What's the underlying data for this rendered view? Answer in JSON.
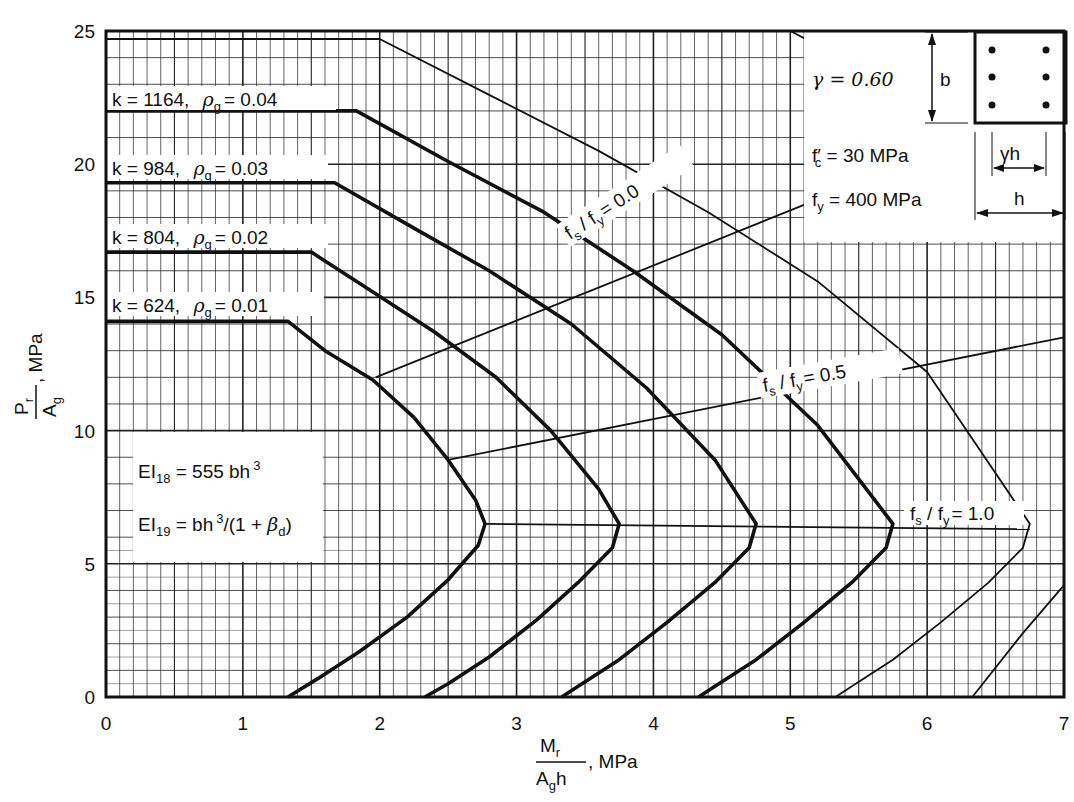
{
  "chart_data": {
    "type": "line",
    "title": "",
    "xlabel": "Mr / (Ag h), MPa",
    "ylabel": "Pr / Ag, MPa",
    "xlabel_parts": {
      "numerator": "M",
      "numerator_sub": "r",
      "denominator": "A",
      "denominator_sub": "g",
      "denominator_tail": "h",
      "unit": ", MPa"
    },
    "ylabel_parts": {
      "numerator": "P",
      "numerator_sub": "r",
      "denominator": "A",
      "denominator_sub": "g",
      "unit": ", MPa"
    },
    "xlim": [
      0,
      7
    ],
    "ylim": [
      0,
      25
    ],
    "xticks": [
      "0",
      "1",
      "2",
      "3",
      "4",
      "5",
      "6",
      "7"
    ],
    "yticks": [
      "0",
      "5",
      "10",
      "15",
      "20",
      "25"
    ],
    "grid": true,
    "parameters": {
      "gamma": "γ  =  0.60",
      "fc": "f′c  =  30  MPa",
      "fy": "fy  =  400  MPa"
    },
    "section_labels": {
      "b": "b",
      "gamma_h": "γh",
      "h": "h"
    },
    "stiffness_notes": [
      "EI18 = 555 bh³",
      "EI19 = bh³/(1 + βd)"
    ],
    "series": [
      {
        "name": "k = 624, ρg = 0.01",
        "k": "624",
        "rho_g": "0.01",
        "weight": "bold",
        "x": [
          0,
          1.33,
          1.6,
          1.95,
          2.25,
          2.5,
          2.7,
          2.77,
          2.72,
          2.5,
          2.2,
          1.85,
          1.55,
          1.33
        ],
        "y": [
          14.1,
          14.1,
          13.0,
          11.9,
          10.5,
          8.9,
          7.4,
          6.5,
          5.7,
          4.4,
          3.0,
          1.7,
          0.7,
          0
        ]
      },
      {
        "name": "k = 804, ρg = 0.02",
        "k": "804",
        "rho_g": "0.02",
        "weight": "bold",
        "x": [
          0,
          1.5,
          1.95,
          2.4,
          2.85,
          3.25,
          3.6,
          3.75,
          3.7,
          3.45,
          3.15,
          2.8,
          2.5,
          2.33
        ],
        "y": [
          16.7,
          16.7,
          15.2,
          13.7,
          12.0,
          10.0,
          7.8,
          6.5,
          5.6,
          4.3,
          2.9,
          1.5,
          0.5,
          0
        ]
      },
      {
        "name": "k = 984, ρg = 0.03",
        "k": "984",
        "rho_g": "0.03",
        "weight": "bold",
        "x": [
          0,
          1.67,
          2.25,
          2.8,
          3.4,
          3.95,
          4.45,
          4.75,
          4.7,
          4.45,
          4.1,
          3.75,
          3.45,
          3.33
        ],
        "y": [
          19.3,
          19.3,
          17.6,
          16.0,
          14.0,
          11.6,
          8.9,
          6.5,
          5.6,
          4.3,
          2.8,
          1.4,
          0.4,
          0
        ]
      },
      {
        "name": "k = 1164, ρg = 0.04",
        "k": "1164",
        "rho_g": "0.04",
        "weight": "bold",
        "x": [
          0,
          1.83,
          2.5,
          3.2,
          3.85,
          4.5,
          5.2,
          5.75,
          5.7,
          5.45,
          5.1,
          4.75,
          4.45,
          4.33
        ],
        "y": [
          22.0,
          22.0,
          20.1,
          18.2,
          16.0,
          13.6,
          10.2,
          6.5,
          5.6,
          4.3,
          2.8,
          1.4,
          0.4,
          0
        ]
      },
      {
        "name": "ρg = 0.05 (unlabeled)",
        "weight": "thin",
        "x": [
          0,
          2.0,
          2.8,
          3.6,
          4.4,
          5.2,
          6.0,
          6.75,
          6.7,
          6.45,
          6.1,
          5.75,
          5.45,
          5.33
        ],
        "y": [
          24.7,
          24.7,
          22.6,
          20.5,
          18.2,
          15.6,
          12.2,
          6.5,
          5.6,
          4.3,
          2.8,
          1.4,
          0.4,
          0
        ]
      },
      {
        "name": "ρg = 0.06 (unlabeled)",
        "weight": "thin",
        "x": [
          5.0,
          5.6,
          6.3,
          7.0
        ],
        "y": [
          25.0,
          23.4,
          21.1,
          18.4
        ]
      },
      {
        "name": "ρg = 0.07 (unlabeled)",
        "weight": "thin",
        "x": [
          6.0,
          6.5,
          7.0
        ],
        "y": [
          25.0,
          23.6,
          21.6
        ]
      },
      {
        "name": "ρg = 0.07 lower branch (unlabeled)",
        "weight": "thin",
        "x": [
          6.33,
          6.7,
          7.0
        ],
        "y": [
          0,
          2.4,
          4.2
        ]
      }
    ],
    "strain_lines": [
      {
        "name": "fs / fy = 0.0",
        "label": "fs / fy = 0.0",
        "x": [
          1.97,
          7.0
        ],
        "y": [
          12.0,
          22.4
        ]
      },
      {
        "name": "fs / fy = 0.5",
        "label": "fs / fy = 0.5",
        "x": [
          2.5,
          7.0
        ],
        "y": [
          8.9,
          13.5
        ]
      },
      {
        "name": "fs / fy = 1.0",
        "label": "fs / fy = 1.0",
        "x": [
          2.77,
          6.75
        ],
        "y": [
          6.5,
          6.3
        ]
      }
    ],
    "legend_position": "inline labels on curves"
  },
  "labels": {
    "series_k": [
      "k = 1164,",
      "k =  984,",
      "k =  804,",
      "k =  624,"
    ],
    "series_rho": [
      "= 0.04",
      "= 0.03",
      "= 0.02",
      "= 0.01"
    ],
    "rho_symbol": "ρ",
    "rho_sub": "g",
    "fs_sym": "f",
    "fs_sub": "s",
    "fy_sub": "y",
    "slash": " / ",
    "fs_values": [
      "= 0.0",
      "= 0.5",
      "= 1.0"
    ],
    "gamma_line": "γ  =  0.60",
    "fc_lhs": "f′",
    "fc_sub": "c",
    "fc_rhs": " =  30  MPa",
    "fy_lhs": "f",
    "fy_rhs": " = 400  MPa",
    "dim_b": "b",
    "dim_gh": "γh",
    "dim_h": "h",
    "ei18_main": "EI",
    "ei18_sub": "18",
    "ei18_rhs": " = 555 bh",
    "ei18_sup": "3",
    "ei19_main": "EI",
    "ei19_sub": "19",
    "ei19_rhs": " = bh",
    "ei19_sup": "3",
    "ei19_tail1": "/(1 + ",
    "ei19_beta": "β",
    "ei19_beta_sub": "d",
    "ei19_tail2": ")",
    "x_num": "M",
    "x_num_sub": "r",
    "x_den": "A",
    "x_den_sub": "g",
    "x_den_tail": "h",
    "x_unit": ", MPa",
    "y_num": "P",
    "y_num_sub": "r",
    "y_den": "A",
    "y_den_sub": "g",
    "y_unit": ", MPa"
  }
}
